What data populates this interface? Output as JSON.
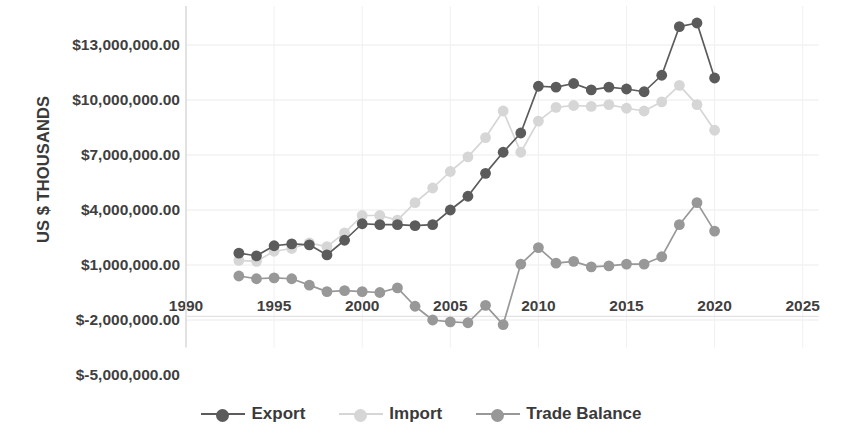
{
  "chart_data": {
    "type": "line",
    "title": "",
    "xlabel": "",
    "ylabel": "US $ THOUSANDS",
    "xlim": [
      1990,
      2025
    ],
    "ylim": [
      -5000000,
      14500000
    ],
    "xticks": [
      "1990",
      "1995",
      "2000",
      "2005",
      "2010",
      "2015",
      "2020",
      "2025"
    ],
    "xtick_values": [
      1990,
      1995,
      2000,
      2005,
      2010,
      2015,
      2020,
      2025
    ],
    "yticks": [
      "$13,000,000.00",
      "$10,000,000.00",
      "$7,000,000.00",
      "$4,000,000.00",
      "$1,000,000.00",
      "$-2,000,000.00",
      "$-5,000,000.00"
    ],
    "ytick_values": [
      13000000,
      10000000,
      7000000,
      4000000,
      1000000,
      -2000000,
      -5000000
    ],
    "grid": true,
    "legend_position": "bottom",
    "x": [
      1993,
      1994,
      1995,
      1996,
      1997,
      1998,
      1999,
      2000,
      2001,
      2002,
      2003,
      2004,
      2005,
      2006,
      2007,
      2008,
      2009,
      2010,
      2011,
      2012,
      2013,
      2014,
      2015,
      2016,
      2017,
      2018,
      2019,
      2020
    ],
    "series": [
      {
        "name": "Export",
        "color": "#5b5b5b",
        "values": [
          1650000,
          1500000,
          2050000,
          2150000,
          2100000,
          1550000,
          2350000,
          3250000,
          3200000,
          3200000,
          3150000,
          3200000,
          4000000,
          4750000,
          6000000,
          7150000,
          8200000,
          10750000,
          10700000,
          10900000,
          10550000,
          10700000,
          10600000,
          10450000,
          11350000,
          14000000,
          14200000,
          11200000
        ]
      },
      {
        "name": "Import",
        "color": "#d6d6d6",
        "values": [
          1250000,
          1200000,
          1750000,
          1900000,
          2200000,
          2000000,
          2750000,
          3700000,
          3700000,
          3450000,
          4400000,
          5200000,
          6100000,
          6900000,
          7950000,
          9400000,
          7150000,
          8850000,
          9600000,
          9700000,
          9650000,
          9750000,
          9550000,
          9400000,
          9900000,
          10800000,
          9750000,
          8350000
        ]
      },
      {
        "name": "Trade Balance",
        "color": "#989898",
        "values": [
          400000,
          250000,
          300000,
          250000,
          -100000,
          -450000,
          -400000,
          -450000,
          -500000,
          -250000,
          -1250000,
          -2000000,
          -2100000,
          -2150000,
          -1200000,
          -2250000,
          1050000,
          1950000,
          1100000,
          1200000,
          900000,
          950000,
          1050000,
          1050000,
          1450000,
          3200000,
          4400000,
          2850000
        ]
      }
    ]
  },
  "legend": {
    "items": [
      {
        "label": "Export",
        "color": "#5b5b5b"
      },
      {
        "label": "Import",
        "color": "#d6d6d6"
      },
      {
        "label": "Trade Balance",
        "color": "#989898"
      }
    ]
  },
  "axes": {
    "y_title": "US $ THOUSANDS"
  }
}
